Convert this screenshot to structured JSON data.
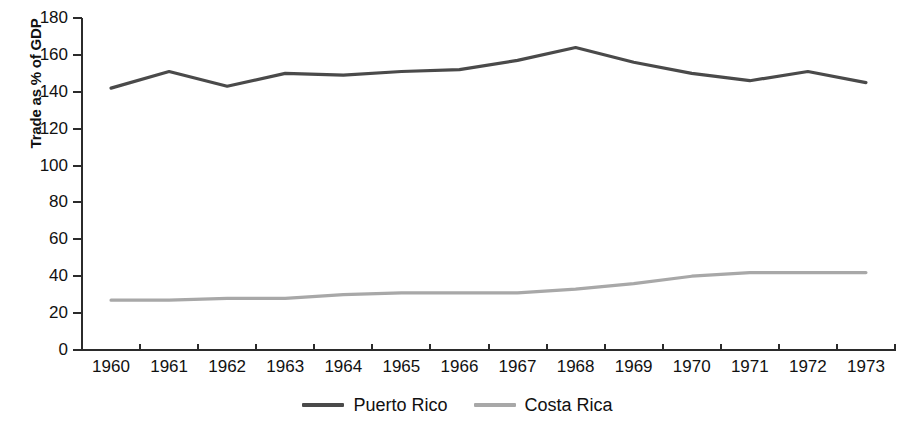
{
  "chart_data": {
    "type": "line",
    "title": "",
    "xlabel": "",
    "ylabel": "Trade as % of GDP",
    "categories": [
      "1960",
      "1961",
      "1962",
      "1963",
      "1964",
      "1965",
      "1966",
      "1967",
      "1968",
      "1969",
      "1970",
      "1971",
      "1972",
      "1973"
    ],
    "x": [
      1960,
      1961,
      1962,
      1963,
      1964,
      1965,
      1966,
      1967,
      1968,
      1969,
      1970,
      1971,
      1972,
      1973
    ],
    "ylim": [
      0,
      180
    ],
    "xlim": [
      1960,
      1973
    ],
    "yticks": [
      0,
      20,
      40,
      60,
      80,
      100,
      120,
      140,
      160,
      180
    ],
    "ytick_labels": [
      "0",
      "20",
      "40",
      "60",
      "80",
      "100",
      "120",
      "140",
      "160",
      "180"
    ],
    "grid": false,
    "legend_position": "bottom-center",
    "series": [
      {
        "name": "Puerto Rico",
        "color": "#4a4a4a",
        "values": [
          142,
          151,
          143,
          150,
          149,
          151,
          152,
          157,
          164,
          156,
          150,
          146,
          151,
          145
        ]
      },
      {
        "name": "Costa Rica",
        "color": "#a8a8a8",
        "values": [
          27,
          27,
          28,
          28,
          30,
          31,
          31,
          31,
          33,
          36,
          40,
          42,
          42,
          42
        ]
      }
    ]
  },
  "axis": {
    "y_title": "Trade as % of GDP"
  },
  "legend": {
    "items": [
      {
        "label": "Puerto Rico",
        "color": "#4a4a4a"
      },
      {
        "label": "Costa Rica",
        "color": "#a8a8a8"
      }
    ]
  },
  "colors": {
    "axis": "#2b2b2b",
    "text": "#111111",
    "background": "#ffffff",
    "series_puerto_rico": "#4a4a4a",
    "series_costa_rica": "#a8a8a8"
  }
}
